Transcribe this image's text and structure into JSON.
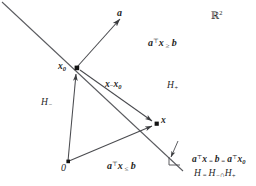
{
  "figure": {
    "domain_label": "ℝ",
    "domain_exponent": "2",
    "space_label_full": "ℝ²",
    "line_color": "#55565a",
    "text_color": "#1f1f1f",
    "background": "#ffffff"
  },
  "labels": {
    "vector_a": "a",
    "point_x0_base": "x",
    "point_x0_sub": "0",
    "point_x0_full": "x₀",
    "segment_x_minus_x0_base": "x",
    "segment_x_minus_x0_minus": "−",
    "segment_x_minus_x0_x": "x",
    "segment_x_minus_x0_sub": "0",
    "segment_x_minus_x0_full": "x − x₀",
    "halfspace_plus_base": "H",
    "halfspace_plus_sign": "+",
    "halfspace_plus_full": "H₊",
    "halfspace_minus_base": "H",
    "halfspace_minus_sign": "−",
    "halfspace_minus_full": "H₋",
    "point_x": "x",
    "origin": "0",
    "inequality_ge_a": "a",
    "inequality_ge_T": "⊤",
    "inequality_ge_x": "x",
    "inequality_ge_rel": "≥",
    "inequality_ge_b": "b",
    "inequality_ge_full": "aᵀx ≥ b",
    "inequality_le_a": "a",
    "inequality_le_T": "⊤",
    "inequality_le_x": "x",
    "inequality_le_rel": "≤",
    "inequality_le_b": "b",
    "inequality_le_full": "aᵀx ≤ b",
    "hyperplane_eq_a1": "a",
    "hyperplane_eq_T1": "⊤",
    "hyperplane_eq_x1": "x",
    "hyperplane_eq_eq1": "=",
    "hyperplane_eq_b": "b",
    "hyperplane_eq_eq2": "=",
    "hyperplane_eq_a2": "a",
    "hyperplane_eq_T2": "⊤",
    "hyperplane_eq_x2": "x",
    "hyperplane_eq_sub2": "0",
    "hyperplane_eq_full": "aᵀx = b = aᵀx₀",
    "hyperplane_def_H": "H",
    "hyperplane_def_eq": "=",
    "hyperplane_def_Hm": "H",
    "hyperplane_def_Hm_sign": "−",
    "hyperplane_def_cap": "∩",
    "hyperplane_def_Hp": "H",
    "hyperplane_def_Hp_sign": "+",
    "hyperplane_def_full": "H = H₋ ∩ H₊"
  },
  "geometry": {
    "hyperplane_line": {
      "x1": 2,
      "y1": 2,
      "x2": 182,
      "y2": 170
    },
    "normal_vector": {
      "x1": 77,
      "y1": 67,
      "x2": 121,
      "y2": 18
    },
    "vector_to_x0": {
      "x1": 68,
      "y1": 162,
      "x2": 76,
      "y2": 70
    },
    "vector_to_x": {
      "x1": 68,
      "y1": 162,
      "x2": 156,
      "y2": 124
    },
    "vector_x0_to_x": {
      "x1": 79,
      "y1": 69,
      "x2": 155,
      "y2": 123
    },
    "pointer_to_hyperplane": {
      "x1": 178,
      "y1": 140,
      "x2": 169,
      "y2": 158
    },
    "point_x0": {
      "cx": 77,
      "cy": 68
    },
    "point_x": {
      "cx": 157,
      "cy": 124
    },
    "point_origin": {
      "cx": 68,
      "cy": 162
    }
  }
}
